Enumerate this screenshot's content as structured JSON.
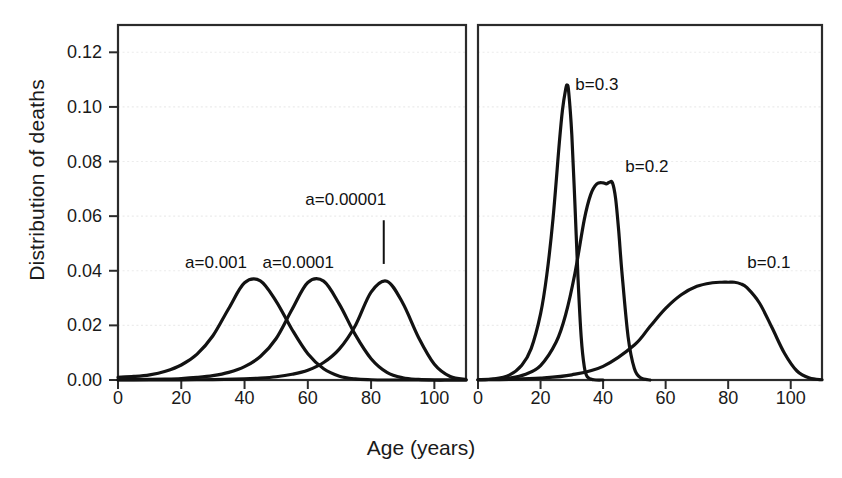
{
  "figure": {
    "xlabel": "Age (years)",
    "ylabel": "Distribution of deaths",
    "stroke_color": "#121212",
    "grid_color": "#ececec",
    "frame_color": "#2b2b2b"
  },
  "chart_data": {
    "type": "line",
    "title": "",
    "xlabel": "Age (years)",
    "ylabel": "Distribution of deaths",
    "xlim": [
      0,
      110
    ],
    "ylim": [
      0,
      0.13
    ],
    "xticks": [
      0,
      20,
      40,
      60,
      80,
      100
    ],
    "yticks": [
      0.0,
      0.02,
      0.04,
      0.06,
      0.08,
      0.1,
      0.12
    ],
    "ytick_labels": [
      "0.00",
      "0.02",
      "0.04",
      "0.06",
      "0.08",
      "0.10",
      "0.12"
    ],
    "xtick_labels": [
      "0",
      "20",
      "40",
      "60",
      "80",
      "100"
    ],
    "grid": true,
    "legend": "none",
    "panels": [
      {
        "name": "left-panel",
        "varied_parameter": "a",
        "fixed_parameter": "b = 0.085",
        "series": [
          {
            "name": "a=0.001",
            "label": "a=0.001",
            "label_x": 31,
            "label_y": 0.0425,
            "peak_x": 41,
            "peak_y": 0.0365,
            "x": [
              0,
              5,
              10,
              15,
              20,
              25,
              30,
              35,
              40,
              45,
              50,
              55,
              60,
              65,
              70,
              75,
              80,
              85,
              90,
              95,
              100,
              105,
              110
            ],
            "y": [
              0.001,
              0.0013,
              0.0019,
              0.0032,
              0.0055,
              0.0095,
              0.0162,
              0.0262,
              0.0356,
              0.0363,
              0.0288,
              0.0185,
              0.0096,
              0.0041,
              0.0014,
              0.0004,
              0.0001,
              0.0,
              0.0,
              0.0,
              0.0,
              0.0,
              0.0
            ]
          },
          {
            "name": "a=0.0001",
            "label": "a=0.0001",
            "label_x": 57,
            "label_y": 0.0425,
            "peak_x": 62,
            "peak_y": 0.0363,
            "x": [
              0,
              5,
              10,
              15,
              20,
              25,
              30,
              35,
              40,
              45,
              50,
              55,
              60,
              65,
              70,
              75,
              80,
              85,
              90,
              95,
              100,
              105,
              110
            ],
            "y": [
              0.0001,
              0.00015,
              0.00023,
              0.00035,
              0.00055,
              0.00095,
              0.0016,
              0.0028,
              0.0049,
              0.0086,
              0.0152,
              0.0258,
              0.0357,
              0.0362,
              0.0277,
              0.0166,
              0.0078,
              0.0028,
              0.0008,
              0.0002,
              0.0,
              0.0,
              0.0
            ]
          },
          {
            "name": "a=0.00001",
            "label": "a=0.00001",
            "label_x": 72,
            "label_y": 0.0655,
            "leader_x": 84,
            "leader_y_top": 0.0585,
            "leader_y_bottom": 0.0425,
            "peak_x": 84,
            "peak_y": 0.0363,
            "x": [
              0,
              10,
              20,
              30,
              40,
              45,
              50,
              55,
              60,
              65,
              70,
              75,
              80,
              85,
              90,
              95,
              100,
              105,
              110
            ],
            "y": [
              1e-05,
              2e-05,
              6e-05,
              0.00016,
              0.00042,
              0.0007,
              0.0012,
              0.0021,
              0.0036,
              0.0064,
              0.0114,
              0.0199,
              0.0322,
              0.0362,
              0.0282,
              0.0156,
              0.0058,
              0.0013,
              0.0002
            ]
          }
        ]
      },
      {
        "name": "right-panel",
        "varied_parameter": "b",
        "fixed_parameter": "a = 0.0001",
        "series": [
          {
            "name": "b=0.3",
            "label": "b=0.3",
            "label_x": 38,
            "label_y": 0.1075,
            "peak_x": 28.5,
            "peak_y": 0.108,
            "x": [
              0,
              5,
              10,
              14,
              17,
              20,
              22,
              24,
              26,
              27,
              28,
              28.5,
              29,
              30,
              31,
              32,
              33,
              34,
              35,
              37,
              40
            ],
            "y": [
              0.0001,
              0.0004,
              0.0018,
              0.0054,
              0.0115,
              0.0242,
              0.0385,
              0.0592,
              0.0868,
              0.0988,
              0.1063,
              0.108,
              0.1055,
              0.0898,
              0.0642,
              0.0368,
              0.0157,
              0.0048,
              0.0011,
              0.0001,
              0.0
            ]
          },
          {
            "name": "b=0.2",
            "label": "b=0.2",
            "label_x": 54,
            "label_y": 0.0775,
            "peak_x": 43,
            "peak_y": 0.0722,
            "x": [
              0,
              5,
              10,
              15,
              20,
              25,
              28,
              31,
              34,
              36,
              38,
              40,
              41,
              42,
              43,
              44,
              45,
              46,
              48,
              50,
              52,
              55
            ],
            "y": [
              0.0001,
              0.00027,
              0.00073,
              0.002,
              0.0053,
              0.0139,
              0.0238,
              0.0391,
              0.0588,
              0.0678,
              0.0718,
              0.0722,
              0.0718,
              0.0724,
              0.0722,
              0.0665,
              0.0545,
              0.0398,
              0.0158,
              0.0042,
              0.0008,
              0.0
            ]
          },
          {
            "name": "b=0.1",
            "label": "b=0.1",
            "label_x": 93,
            "label_y": 0.0425,
            "peak_x": 82,
            "peak_y": 0.0358,
            "x": [
              0,
              10,
              20,
              30,
              40,
              50,
              55,
              60,
              65,
              70,
              75,
              78,
              80,
              82,
              84,
              86,
              90,
              94,
              98,
              102,
              106,
              110
            ],
            "y": [
              0.0001,
              0.00026,
              0.0007,
              0.0019,
              0.005,
              0.0128,
              0.0196,
              0.0262,
              0.0312,
              0.0343,
              0.0356,
              0.0358,
              0.0358,
              0.0358,
              0.0352,
              0.0338,
              0.0282,
              0.0192,
              0.0098,
              0.0033,
              0.0007,
              0.0001
            ]
          }
        ]
      }
    ]
  },
  "axes": {
    "ytick_labels": [
      "0.00",
      "0.02",
      "0.04",
      "0.06",
      "0.08",
      "0.10",
      "0.12"
    ],
    "xtick_labels_left": [
      "0",
      "20",
      "40",
      "60",
      "80",
      "100"
    ],
    "xtick_labels_right": [
      "0",
      "20",
      "40",
      "60",
      "80",
      "100"
    ]
  }
}
